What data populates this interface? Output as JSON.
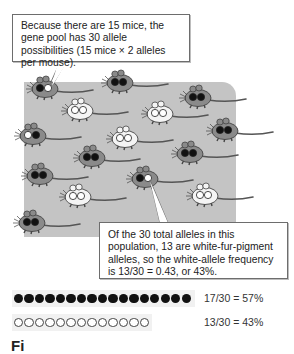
{
  "callouts": {
    "top": "Because there are 15 mice, the gene pool has 30 allele possibilities (15 mice × 2 alleles per mouse).",
    "bottom": "Of the 30 total alleles in this population, 13 are white-fur-pigment alleles, so the white-allele frequency is 13/30 = 0.43, or 43%."
  },
  "population": {
    "mouse_count": 15,
    "total_alleles": 30,
    "mice": [
      {
        "x": 45,
        "y": 88,
        "alleles": [
          "dark",
          "white"
        ],
        "pointer": "top"
      },
      {
        "x": 120,
        "y": 82,
        "alleles": [
          "dark",
          "dark"
        ]
      },
      {
        "x": 198,
        "y": 97,
        "alleles": [
          "dark",
          "dark"
        ]
      },
      {
        "x": 80,
        "y": 110,
        "alleles": [
          "white",
          "white"
        ]
      },
      {
        "x": 160,
        "y": 113,
        "alleles": [
          "white",
          "white"
        ]
      },
      {
        "x": 225,
        "y": 130,
        "alleles": [
          "dark",
          "dark"
        ]
      },
      {
        "x": 33,
        "y": 135,
        "alleles": [
          "white",
          "dark"
        ]
      },
      {
        "x": 125,
        "y": 138,
        "alleles": [
          "white",
          "white"
        ]
      },
      {
        "x": 92,
        "y": 157,
        "alleles": [
          "dark",
          "dark"
        ]
      },
      {
        "x": 190,
        "y": 153,
        "alleles": [
          "dark",
          "dark"
        ]
      },
      {
        "x": 40,
        "y": 175,
        "alleles": [
          "dark",
          "dark"
        ]
      },
      {
        "x": 145,
        "y": 178,
        "alleles": [
          "dark",
          "white"
        ],
        "pointer": "bottom"
      },
      {
        "x": 78,
        "y": 196,
        "alleles": [
          "white",
          "white"
        ]
      },
      {
        "x": 205,
        "y": 195,
        "alleles": [
          "white",
          "white"
        ]
      },
      {
        "x": 32,
        "y": 222,
        "alleles": [
          "dark",
          "dark"
        ]
      }
    ]
  },
  "allele_summary": {
    "dark": {
      "count": 17,
      "label": "17/30 = 57%"
    },
    "white": {
      "count": 13,
      "label": "13/30 = 43%"
    }
  },
  "figure_label": "Fi",
  "colors": {
    "background_box": "#c4c4c4",
    "dark_mouse": "#8a8a8a",
    "white_mouse": "#f4f4f4",
    "dark_allele": "#111111",
    "white_allele": "#ffffff"
  }
}
